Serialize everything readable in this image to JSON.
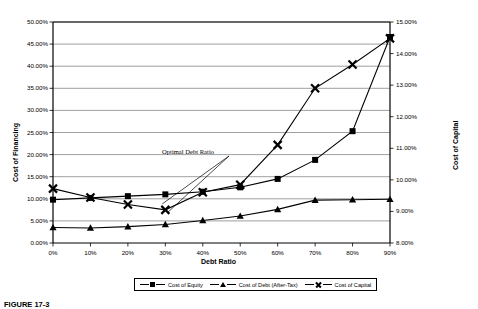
{
  "chart_data": {
    "type": "line",
    "title": "",
    "xlabel": "Debt Ratio",
    "ylabel": "Cost of Financing",
    "ylabel_right": "Cost of Capital",
    "categories": [
      "0%",
      "10%",
      "20%",
      "30%",
      "40%",
      "50%",
      "60%",
      "70%",
      "80%",
      "90%"
    ],
    "x": [
      0,
      10,
      20,
      30,
      40,
      50,
      60,
      70,
      80,
      90
    ],
    "ylim": [
      0,
      50
    ],
    "ylim_right": [
      8,
      15
    ],
    "yticks": [
      "0.00%",
      "5.00%",
      "10.00%",
      "15.00%",
      "20.00%",
      "25.00%",
      "30.00%",
      "35.00%",
      "40.00%",
      "45.00%",
      "50.00%"
    ],
    "yticks_right": [
      "8.00%",
      "9.00%",
      "10.00%",
      "11.00%",
      "12.00%",
      "13.00%",
      "14.00%",
      "15.00%"
    ],
    "grid": true,
    "legend_position": "bottom",
    "series": [
      {
        "name": "Cost of Equity",
        "marker": "square",
        "axis": "left",
        "values": [
          9.8,
          10.2,
          10.6,
          11.0,
          11.6,
          12.6,
          14.5,
          18.8,
          25.3,
          46.6
        ]
      },
      {
        "name": "Cost of Debt (After-Tax)",
        "marker": "triangle",
        "axis": "left",
        "values": [
          3.5,
          3.4,
          3.7,
          4.2,
          5.1,
          6.1,
          7.6,
          9.7,
          9.8,
          9.9
        ]
      },
      {
        "name": "Cost of Capital",
        "marker": "x",
        "axis": "left",
        "values": [
          12.3,
          10.3,
          8.7,
          7.5,
          11.5,
          13.2,
          22.2,
          35.0,
          40.4,
          46.3
        ]
      }
    ],
    "annotations": [
      {
        "text": "Optimal Debt Ratio",
        "points_to_x": 30,
        "points_to_y": 7.5
      }
    ]
  },
  "legend": {
    "items": [
      {
        "label": "Cost of Equity",
        "marker": "square-marker"
      },
      {
        "label": "Cost of Debt (After-Tax)",
        "marker": "triangle-marker"
      },
      {
        "label": "Cost of Capital",
        "marker": "x-marker"
      }
    ]
  },
  "caption": {
    "text": "FIGURE 17-3"
  },
  "colors": {
    "series": "#000000",
    "grid": "#808080",
    "axis": "#000000",
    "background": "#ffffff"
  }
}
